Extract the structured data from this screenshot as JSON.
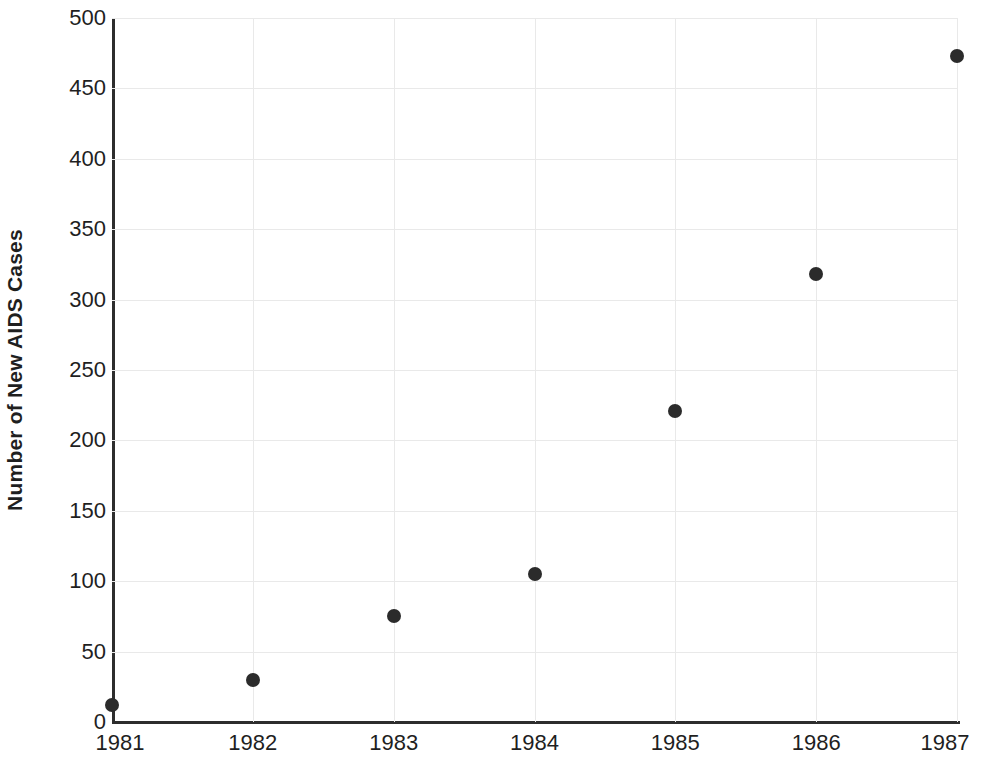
{
  "chart_data": {
    "type": "scatter",
    "title": "",
    "xlabel": "",
    "ylabel": "Number of New AIDS Cases",
    "categories": [
      "1981",
      "1982",
      "1983",
      "1984",
      "1985",
      "1986",
      "1987"
    ],
    "x": [
      1981,
      1982,
      1983,
      1984,
      1985,
      1986,
      1987
    ],
    "values": [
      12,
      30,
      75,
      105,
      221,
      318,
      473
    ],
    "series": [
      {
        "name": "New AIDS Cases",
        "values": [
          12,
          30,
          75,
          105,
          221,
          318,
          473
        ]
      }
    ],
    "points": [
      {
        "x": "1981",
        "y": 12
      },
      {
        "x": "1982",
        "y": 30
      },
      {
        "x": "1983",
        "y": 75
      },
      {
        "x": "1984",
        "y": 105
      },
      {
        "x": "1985",
        "y": 221
      },
      {
        "x": "1986",
        "y": 318
      },
      {
        "x": "1987",
        "y": 473
      }
    ],
    "ylim": [
      0,
      500
    ],
    "xlim": [
      1981,
      1987
    ],
    "y_ticks": [
      0,
      50,
      100,
      150,
      200,
      250,
      300,
      350,
      400,
      450,
      500
    ],
    "y_tick_labels": [
      "0",
      "50",
      "100",
      "150",
      "200",
      "250",
      "300",
      "350",
      "400",
      "450",
      "500"
    ],
    "x_ticks": [
      1981,
      1982,
      1983,
      1984,
      1985,
      1986,
      1987
    ],
    "x_tick_labels": [
      "1981",
      "1982",
      "1983",
      "1984",
      "1985",
      "1986",
      "1987"
    ],
    "grid": true,
    "legend": false,
    "legend_position": "none",
    "colors": {
      "point": "#2b2b2b",
      "axis": "#2d2d2d",
      "grid": "#e9e9e9",
      "text": "#1f1f1f",
      "background": "#ffffff"
    }
  }
}
